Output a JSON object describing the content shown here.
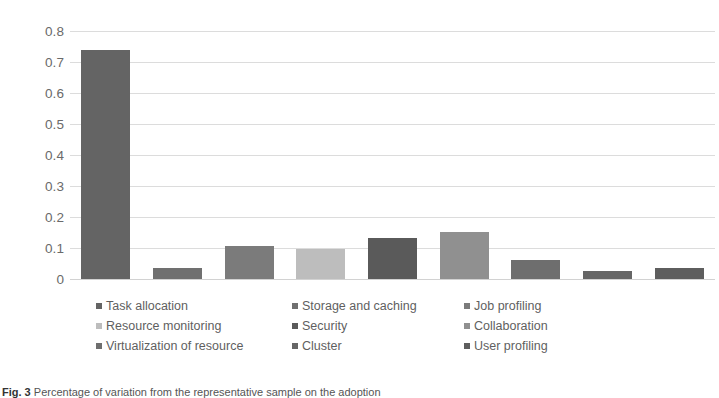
{
  "chart_data": {
    "type": "bar",
    "title": "",
    "xlabel": "",
    "ylabel": "",
    "ylim": [
      0,
      0.8
    ],
    "grid": true,
    "legend_position": "bottom",
    "y_ticks": [
      "0",
      "0.1",
      "0.2",
      "0.3",
      "0.4",
      "0.5",
      "0.6",
      "0.7",
      "0.8"
    ],
    "categories": [
      "Task allocation",
      "Storage and caching",
      "Job profiling",
      "Resource monitoring",
      "Security",
      "Collaboration",
      "Virtualization of resource",
      "Cluster",
      "User profiling"
    ],
    "values": [
      0.675,
      0.033,
      0.098,
      0.088,
      0.12,
      0.14,
      0.055,
      0.025,
      0.033
    ],
    "colors": [
      "#646464",
      "#707070",
      "#7b7b7b",
      "#bdbdbd",
      "#5a5a5a",
      "#909090",
      "#6e6e6e",
      "#666666",
      "#5e5e5e"
    ]
  },
  "legend": {
    "rows": [
      [
        {
          "label": "Task allocation",
          "color": "#646464"
        },
        {
          "label": "Storage and caching",
          "color": "#707070"
        },
        {
          "label": "Job profiling",
          "color": "#7b7b7b"
        }
      ],
      [
        {
          "label": "Resource monitoring",
          "color": "#bdbdbd"
        },
        {
          "label": "Security",
          "color": "#5a5a5a"
        },
        {
          "label": "Collaboration",
          "color": "#909090"
        }
      ],
      [
        {
          "label": "Virtualization of resource",
          "color": "#6e6e6e"
        },
        {
          "label": "Cluster",
          "color": "#666666"
        },
        {
          "label": "User profiling",
          "color": "#5e5e5e"
        }
      ]
    ]
  },
  "caption": {
    "prefix": "Fig. 3",
    "text": "Percentage of variation from the representative sample on the adoption"
  }
}
